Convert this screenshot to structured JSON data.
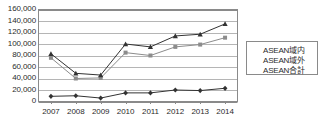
{
  "chart_data": {
    "type": "line",
    "title": "",
    "subtitle": "",
    "xlabel": "",
    "ylabel": "",
    "categories": [
      "2007",
      "2008",
      "2009",
      "2010",
      "2011",
      "2012",
      "2013",
      "2014"
    ],
    "x": [
      2007,
      2008,
      2009,
      2010,
      2011,
      2012,
      2013,
      2014
    ],
    "ylim": [
      0,
      160000
    ],
    "ytick_values": [
      0,
      20000,
      40000,
      60000,
      80000,
      100000,
      120000,
      140000,
      160000
    ],
    "ytick_labels": [
      "0",
      "20,000",
      "40,000",
      "60,000",
      "80,000",
      "100,000",
      "120,000",
      "140,000",
      "160,000"
    ],
    "grid": "horizontal",
    "legend_position": "right",
    "series": [
      {
        "name": "ASEAN域内",
        "marker": "diamond",
        "color": "#333333",
        "values": [
          9000,
          10000,
          6000,
          15000,
          15000,
          20000,
          19000,
          23000
        ]
      },
      {
        "name": "ASEAN域外",
        "marker": "square",
        "color": "#8c8c8c",
        "values": [
          76000,
          40000,
          41000,
          85000,
          80000,
          95000,
          99000,
          111000
        ]
      },
      {
        "name": "ASEAN合計",
        "marker": "triangle",
        "color": "#333333",
        "values": [
          83000,
          49000,
          46000,
          100000,
          95000,
          114000,
          117000,
          135000
        ]
      }
    ]
  },
  "axis": {
    "y_axis_name": "value-axis",
    "x_axis_name": "year-axis"
  },
  "legend": {
    "entries": [
      {
        "label": "ASEAN域内",
        "marker": "diamond-marker"
      },
      {
        "label": "ASEAN域外",
        "marker": "square-marker"
      },
      {
        "label": "ASEAN合計",
        "marker": "triangle-marker"
      }
    ]
  },
  "colors": {
    "plot_border": "#8a8a8a",
    "gridline": "#b5b5b5",
    "series_dark": "#333333",
    "series_gray": "#8c8c8c",
    "text": "#2b2b2b",
    "background": "#ffffff"
  }
}
